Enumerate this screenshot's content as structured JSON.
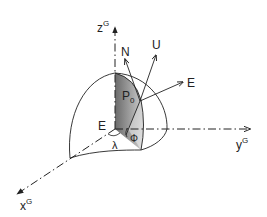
{
  "diagram": {
    "axes": {
      "z": {
        "base": "z",
        "sup": "G"
      },
      "y": {
        "base": "y",
        "sup": "G"
      },
      "x": {
        "base": "x",
        "sup": "G"
      }
    },
    "origin_label": "E",
    "point": {
      "base": "P",
      "sub": "0"
    },
    "local_axes": {
      "north": "N",
      "up": "U",
      "east": "E"
    },
    "angles": {
      "longitude": "λ",
      "latitude": "Φ"
    },
    "colors": {
      "stroke": "#222222",
      "shade_dark": "#6e6e6e",
      "shade_light": "#d6d6d6"
    }
  }
}
